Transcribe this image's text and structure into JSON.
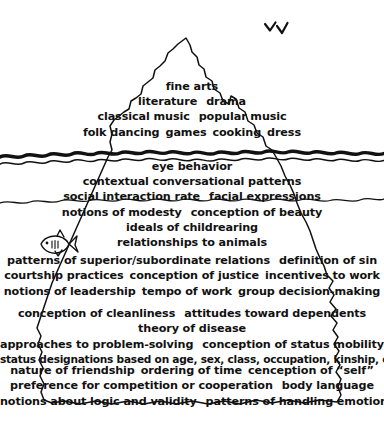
{
  "diagram": {
    "type": "iceberg-diagram",
    "ink_color": "#111111",
    "background_color": "#ffffff"
  },
  "scenery": {
    "birds_icon": "birds-icon",
    "bird_count": 2,
    "fish_icon": "fish-icon",
    "fish_count": 1,
    "waterline_icon": "waterline-wave",
    "subdivider_icon": "wave-divider"
  },
  "bands": {
    "visible": {
      "id": "above-water-visible-culture",
      "lines": [
        [
          "fine arts"
        ],
        [
          "literature",
          "drama"
        ],
        [
          "classical music",
          "popular music"
        ],
        [
          "folk dancing",
          "games",
          "cooking",
          "dress"
        ]
      ]
    },
    "surface": {
      "id": "just-below-surface",
      "lines": [
        [
          "eye behavior"
        ],
        [
          "contextual conversational patterns"
        ],
        [
          "social interaction rate",
          "facial expressions"
        ]
      ]
    },
    "shallow": {
      "id": "shallow-unconscious",
      "lines": [
        [
          "notions of modesty",
          "conception of beauty"
        ],
        [
          "ideals of childrearing"
        ],
        [
          "relationships to animals"
        ]
      ]
    },
    "mid": {
      "id": "mid-deep-culture",
      "lines": [
        [
          "patterns of superior/subordinate relations",
          "definition of sin"
        ],
        [
          "courtship practices",
          "conception of justice",
          "incentives to work"
        ],
        [
          "notions of leadership",
          "tempo of work",
          "group decision-making"
        ]
      ]
    },
    "deep": {
      "id": "deep-culture",
      "lines": [
        [
          "conception of cleanliness",
          "attitudes toward dependents"
        ],
        [
          "theory of disease"
        ],
        [
          "approaches to problem-solving",
          "conception of status mobility"
        ],
        [
          "status designations based on age, sex, class, occupation, kinship, etc."
        ]
      ]
    },
    "deepest": {
      "id": "deepest-culture",
      "lines": [
        [
          "nature of friendship",
          "ordering of time",
          "cenception of “self”"
        ],
        [
          "preference for competition or cooperation",
          "body language"
        ],
        [
          "notions about logic and validity",
          "patterns of handling emotions"
        ]
      ]
    }
  }
}
